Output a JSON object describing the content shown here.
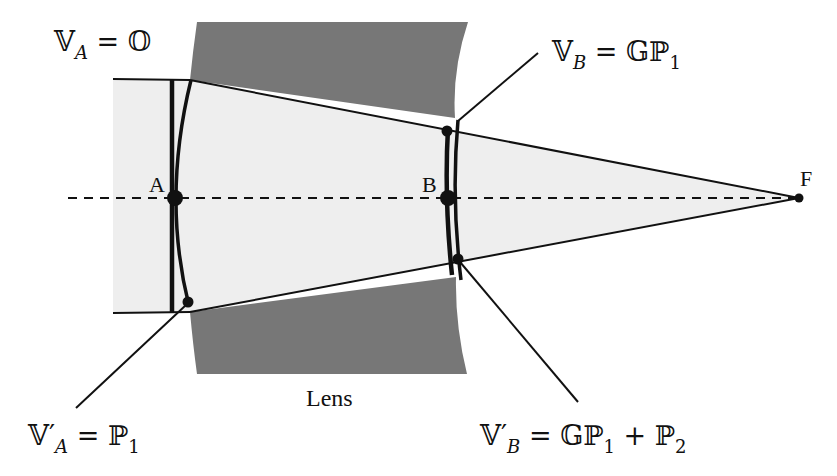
{
  "figure": {
    "type": "optics-wavefront-diagram",
    "colors": {
      "background": "#ffffff",
      "lens_fill": "#777777",
      "beam_fill": "#eeeeee",
      "line": "#111111"
    },
    "points": {
      "A": "A",
      "B": "B",
      "F": "F"
    },
    "lens_label": "Lens",
    "annotations": [
      {
        "id": "va",
        "lhs": "𝕍",
        "sub": "A",
        "eq": "=",
        "rhs": "𝕆",
        "rhs_sub": ""
      },
      {
        "id": "vb",
        "lhs": "𝕍",
        "sub": "B",
        "eq": "=",
        "rhs": "𝔾ℙ",
        "rhs_sub": "1"
      },
      {
        "id": "vpa",
        "lhs": "𝕍′",
        "sub": "A",
        "eq": "=",
        "rhs": "ℙ",
        "rhs_sub": "1"
      },
      {
        "id": "vpb",
        "lhs": "𝕍′",
        "sub": "B",
        "eq": "=",
        "rhs": "𝔾ℙ",
        "rhs_sub": "1",
        "plus": "+",
        "rhs2": "ℙ",
        "rhs2_sub": "2"
      }
    ]
  }
}
